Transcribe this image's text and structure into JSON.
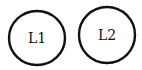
{
  "diagram": {
    "nodes": [
      {
        "id": "L1",
        "label": "L1",
        "cx": 37,
        "cy": 38,
        "rx": 28,
        "ry": 27
      },
      {
        "id": "L2",
        "label": "L2",
        "cx": 107,
        "cy": 35,
        "rx": 28,
        "ry": 28
      }
    ],
    "stroke_color": "#111111",
    "background": "#ffffff"
  }
}
